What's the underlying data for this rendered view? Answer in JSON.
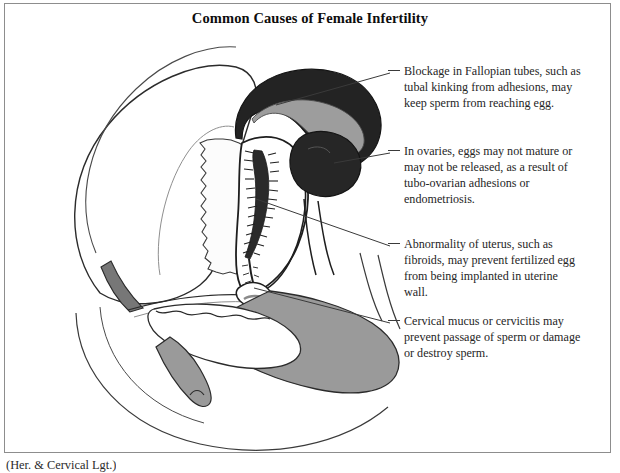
{
  "figure": {
    "title": "Common Causes of Female Infertility",
    "caption": "(Her. & Cervical Lgt.)"
  },
  "colors": {
    "ink": "#1a1a1a",
    "outline": "#262626",
    "frame_border": "#8d8d8d",
    "fill_dark": "#2a2a2a",
    "fill_mid_gray": "#9a9a9a",
    "fill_light_gray": "#b5b5b5",
    "page_background": "#ffffff",
    "leader_line": "#3a3a3a"
  },
  "callouts": [
    {
      "id": "tubes",
      "name": "blockage-in-fallopian-tubes",
      "text": "Blockage in Fallopian tubes, such as tubal kinking from adhesions, may keep sperm from reaching egg.",
      "dash_x": 388,
      "dash_y": 70,
      "leader_from": [
        275,
        102
      ],
      "leader_to": [
        386,
        70
      ]
    },
    {
      "id": "ovaries",
      "name": "in-ovaries-eggs-may-not-mature",
      "text": "In ovaries, eggs may not mature or may not be released, as a result of tubo-ovarian adhesions or endometriosis.",
      "dash_x": 388,
      "dash_y": 150,
      "leader_from": [
        317,
        123
      ],
      "leader_to": [
        386,
        150
      ]
    },
    {
      "id": "uterus",
      "name": "abnormality-of-uterus-fibroids",
      "text": "Abnormality of uterus, such as fibroids, may prevent fertilized egg from being implanted in uterine wall.",
      "dash_x": 388,
      "dash_y": 243,
      "leader_from": [
        258,
        198
      ],
      "leader_to": [
        386,
        243
      ]
    },
    {
      "id": "cervix",
      "name": "cervical-mucus-or-cervicitis",
      "text": "Cervical mucus or cervicitis may prevent passage of sperm or damage or destroy sperm.",
      "dash_x": 388,
      "dash_y": 320,
      "leader_from": [
        253,
        286
      ],
      "leader_to": [
        386,
        320
      ]
    }
  ],
  "anatomy_parts": [
    {
      "name": "bladder",
      "fill": "none",
      "note": "large rounded organ, left of center"
    },
    {
      "name": "bladder-lumen",
      "fill": "none",
      "note": "jagged inner outline"
    },
    {
      "name": "uterus-body",
      "fill": "none",
      "note": "pear shape, center"
    },
    {
      "name": "endometrial-cavity",
      "fill": "#2a2a2a",
      "note": "dark spiky vertical band"
    },
    {
      "name": "fallopian-tube",
      "fill": "#2a2a2a",
      "note": "dark curved arc, upper right"
    },
    {
      "name": "fallopian-tube-lumen",
      "fill": "#9a9a9a",
      "note": "mid-gray inner channel"
    },
    {
      "name": "ovary",
      "fill": "#2a2a2a",
      "note": "dark rounded mass"
    },
    {
      "name": "cervix",
      "fill": "#9a9a9a",
      "note": "small gray knob below uterus"
    },
    {
      "name": "vagina",
      "fill": "#9a9a9a",
      "note": "gray band running lower right"
    },
    {
      "name": "rectum",
      "fill": "#9a9a9a",
      "note": "broad gray region, lower right"
    },
    {
      "name": "pelvic-bone-arc",
      "fill": "none",
      "note": "large sweeping lower arc"
    },
    {
      "name": "pubic-symphysis",
      "fill": "#9a9a9a",
      "note": "small gray wedge, left"
    }
  ]
}
